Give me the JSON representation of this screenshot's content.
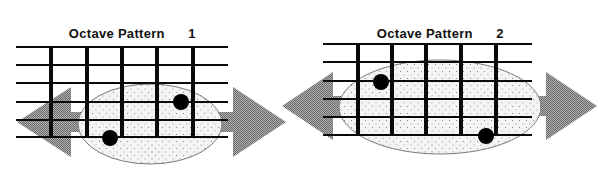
{
  "diagrams": [
    {
      "title": "Octave Pattern",
      "number": "1",
      "strings_y": [
        47,
        65,
        83,
        102,
        120,
        137
      ],
      "string_x": [
        16,
        228
      ],
      "frets_x": [
        51,
        87,
        122,
        157,
        193
      ],
      "fret_y": [
        47,
        137
      ],
      "ellipse": {
        "cx": 150,
        "cy": 124,
        "rx": 72,
        "ry": 40
      },
      "dots": [
        {
          "x": 110,
          "y": 138
        },
        {
          "x": 181,
          "y": 102
        }
      ],
      "left_arrow": {
        "tip_x": 17,
        "base_x": 71,
        "cy": 122,
        "head_half": 35,
        "shaft_end_x": 100,
        "shaft_half": 10
      },
      "right_arrow": {
        "tip_x": 286,
        "base_x": 233,
        "cy": 122,
        "head_half": 35,
        "shaft_start_x": 212,
        "shaft_half": 10
      }
    },
    {
      "title": "Octave Pattern",
      "number": "2",
      "strings_y": [
        44,
        62,
        81,
        99,
        117,
        135
      ],
      "string_x": [
        323,
        532
      ],
      "frets_x": [
        358,
        392,
        426,
        461,
        496
      ],
      "fret_y": [
        44,
        135
      ],
      "ellipse": {
        "cx": 440,
        "cy": 107,
        "rx": 101,
        "ry": 47
      },
      "dots": [
        {
          "x": 381,
          "y": 82
        },
        {
          "x": 486,
          "y": 136
        }
      ],
      "left_arrow": {
        "tip_x": 282,
        "base_x": 333,
        "cy": 106,
        "head_half": 34,
        "shaft_end_x": 350,
        "shaft_half": 10
      },
      "right_arrow": {
        "tip_x": 597,
        "base_x": 546,
        "cy": 106,
        "head_half": 34,
        "shaft_start_x": 528,
        "shaft_half": 10
      }
    }
  ],
  "colors": {
    "line": "#0a0a0a",
    "arrow": "#8a8a8a",
    "ellipse_fill": "#ececec",
    "ellipse_stroke": "#7a7a7a",
    "dot": "#000000"
  }
}
